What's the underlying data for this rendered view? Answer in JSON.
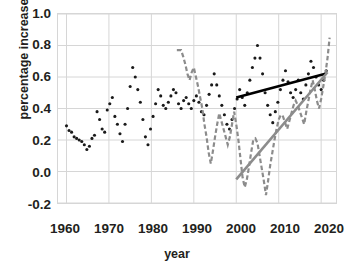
{
  "ghost_text": "  ",
  "axes": {
    "x_title": "year",
    "y_title": "percentage increase",
    "x_ticks": [
      "1960",
      "1970",
      "1980",
      "1990",
      "2000",
      "2010",
      "2020"
    ],
    "y_ticks": [
      "1.0",
      "0.8",
      "0.6",
      "0.4",
      "0.2",
      "0.0",
      "-0.2"
    ]
  },
  "chart_data": {
    "type": "scatter",
    "title": "",
    "xlabel": "year",
    "ylabel": "percentage increase",
    "xlim": [
      1958,
      2023.5
    ],
    "ylim": [
      -0.2,
      1.0
    ],
    "ytick_values": [
      1.0,
      0.8,
      0.6,
      0.4,
      0.2,
      0.0,
      -0.2
    ],
    "xtick_values": [
      1960,
      1970,
      1980,
      1990,
      2000,
      2010,
      2020
    ],
    "grid": true,
    "legend": "none",
    "colors": {
      "black_series": "#1a1a1a",
      "gray_series": "#8c8c8c",
      "gridline": "#d6d6d6",
      "background": "#ffffff"
    },
    "series": [
      {
        "name": "black-dotted-scatter",
        "style": "dotted",
        "marker": "round-dot",
        "color": "#1a1a1a",
        "x": [
          1960,
          1960.6,
          1961.2,
          1961.8,
          1962.4,
          1963,
          1963.6,
          1964.2,
          1964.8,
          1965.4,
          1966,
          1966.6,
          1967.2,
          1967.8,
          1968.4,
          1969,
          1969.6,
          1970.2,
          1970.8,
          1971.4,
          1972,
          1972.6,
          1973.2,
          1973.8,
          1974.4,
          1975,
          1975.6,
          1976.2,
          1976.8,
          1977.4,
          1978,
          1978.6,
          1979.2,
          1979.8,
          1980.4,
          1981,
          1981.6,
          1982.2,
          1982.8,
          1983.4,
          1984,
          1984.6,
          1985.2,
          1985.8,
          1986.4,
          1987,
          1987.6,
          1988.2,
          1988.8,
          1989.4,
          1990,
          1990.6,
          1991.2,
          1991.8,
          1992.4,
          1993,
          1993.6,
          1994.2,
          1994.8,
          1995.4,
          1996,
          1996.6,
          1997.2,
          1997.8,
          1998.4,
          1999,
          1999.6,
          2000.2,
          2000.8,
          2001.4,
          2002,
          2002.6,
          2003.2,
          2003.8,
          2004.4,
          2005,
          2005.6,
          2006.2,
          2006.8,
          2007.4,
          2008,
          2008.6,
          2009.2,
          2009.8,
          2010.4,
          2011,
          2011.6,
          2012.2,
          2012.8,
          2013.4,
          2014,
          2014.6,
          2015.2,
          2015.8,
          2016.4,
          2017,
          2017.6,
          2018.2,
          2018.8,
          2019.4,
          2020,
          2020.6,
          2021.2
        ],
        "y": [
          0.29,
          0.26,
          0.25,
          0.22,
          0.21,
          0.2,
          0.19,
          0.17,
          0.14,
          0.16,
          0.21,
          0.23,
          0.38,
          0.33,
          0.27,
          0.25,
          0.39,
          0.43,
          0.47,
          0.35,
          0.3,
          0.24,
          0.19,
          0.3,
          0.4,
          0.54,
          0.66,
          0.6,
          0.52,
          0.44,
          0.33,
          0.22,
          0.17,
          0.27,
          0.35,
          0.43,
          0.52,
          0.48,
          0.42,
          0.4,
          0.44,
          0.48,
          0.52,
          0.5,
          0.43,
          0.4,
          0.45,
          0.47,
          0.43,
          0.4,
          0.45,
          0.48,
          0.44,
          0.38,
          0.36,
          0.42,
          0.49,
          0.55,
          0.62,
          0.55,
          0.48,
          0.42,
          0.36,
          0.3,
          0.27,
          0.33,
          0.4,
          0.46,
          0.52,
          0.47,
          0.42,
          0.5,
          0.58,
          0.66,
          0.72,
          0.8,
          0.72,
          0.62,
          0.5,
          0.42,
          0.36,
          0.31,
          0.38,
          0.44,
          0.52,
          0.58,
          0.64,
          0.57,
          0.5,
          0.47,
          0.52,
          0.58,
          0.5,
          0.46,
          0.55,
          0.62,
          0.7,
          0.66,
          0.6,
          0.55,
          0.52,
          0.58,
          0.64
        ]
      },
      {
        "name": "gray-dashed-line",
        "style": "dashed",
        "color": "#8c8c8c",
        "x": [
          1986,
          1986.5,
          1987,
          1987.5,
          1988,
          1988.5,
          1989,
          1989.5,
          1990,
          1990.5,
          1991,
          1991.5,
          1992,
          1992.5,
          1993,
          1993.5,
          1994,
          1994.5,
          1995,
          1995.5,
          1996,
          1996.5,
          1997,
          1997.5,
          1998,
          1998.5,
          1999,
          1999.5,
          2000,
          2000.5,
          2001,
          2001.5,
          2002,
          2002.5,
          2003,
          2003.5,
          2004,
          2004.5,
          2005,
          2005.5,
          2006,
          2006.5,
          2007,
          2007.5,
          2008,
          2008.5,
          2009,
          2009.5,
          2010,
          2010.5,
          2011,
          2011.5,
          2012,
          2012.5,
          2013,
          2013.5,
          2014,
          2014.5,
          2015,
          2015.5,
          2016,
          2016.5,
          2017,
          2017.5,
          2018,
          2018.5,
          2019,
          2019.5,
          2020,
          2020.5,
          2021,
          2021.5,
          2022
        ],
        "y": [
          0.77,
          0.77,
          0.77,
          0.73,
          0.68,
          0.62,
          0.58,
          0.63,
          0.66,
          0.6,
          0.54,
          0.47,
          0.4,
          0.3,
          0.22,
          0.12,
          0.05,
          0.13,
          0.22,
          0.3,
          0.37,
          0.32,
          0.27,
          0.22,
          0.17,
          0.22,
          0.3,
          0.38,
          0.3,
          0.2,
          0.08,
          -0.04,
          -0.1,
          -0.05,
          0.03,
          0.12,
          0.2,
          0.21,
          0.18,
          0.1,
          0.02,
          -0.06,
          -0.15,
          -0.06,
          0.04,
          0.12,
          0.2,
          0.27,
          0.33,
          0.36,
          0.35,
          0.31,
          0.27,
          0.32,
          0.37,
          0.42,
          0.45,
          0.42,
          0.38,
          0.34,
          0.3,
          0.38,
          0.45,
          0.52,
          0.58,
          0.52,
          0.45,
          0.4,
          0.46,
          0.54,
          0.62,
          0.72,
          0.85
        ]
      },
      {
        "name": "black-trendline",
        "style": "solid",
        "color": "#000000",
        "x": [
          2000,
          2021
        ],
        "y": [
          0.47,
          0.62
        ]
      },
      {
        "name": "gray-trendline",
        "style": "solid",
        "color": "#8c8c8c",
        "x": [
          2000,
          2021.5
        ],
        "y": [
          -0.05,
          0.63
        ]
      }
    ]
  }
}
